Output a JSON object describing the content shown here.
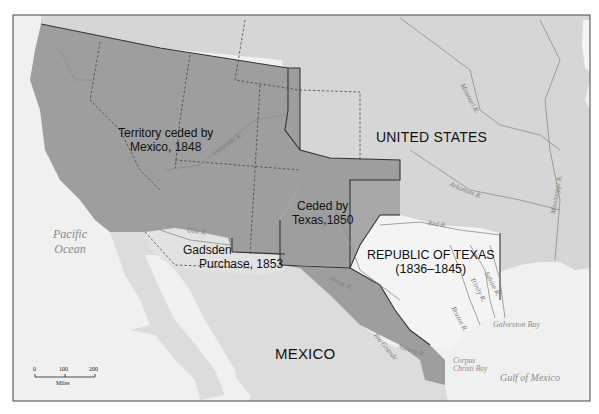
{
  "map": {
    "colors": {
      "ocean": "#f0f0f0",
      "united_states": "#d6d6d6",
      "mexico": "#dcdcdc",
      "cession_1848": "#9e9e9e",
      "texas_cession_1850": "#9e9e9e",
      "republic_of_texas": "#f4f4f4",
      "gadsden_purchase": "#e2e2e2",
      "border_line": "#333333",
      "river_line": "#8c8c8c"
    },
    "region_labels": {
      "cession_1848_line1": "Territory ceded by",
      "cession_1848_line2": "Mexico, 1848",
      "united_states": "UNITED STATES",
      "texas_cession_line1": "Ceded by",
      "texas_cession_line2": "Texas,1850",
      "republic_line1": "REPUBLIC OF TEXAS",
      "republic_line2": "(1836–1845)",
      "gadsden_line1": "Gadsden",
      "gadsden_line2": "Purchase, 1853",
      "mexico": "MEXICO"
    },
    "water_labels": {
      "pacific_line1": "Pacific",
      "pacific_line2": "Ocean",
      "gulf": "Gulf of Mexico",
      "galveston": "Galveston Bay",
      "corpus_line1": "Corpus",
      "corpus_line2": "Christi Bay"
    },
    "rivers": {
      "colorado": "Colorado R.",
      "gila": "Gila R.",
      "missouri": "Missouri R.",
      "arkansas": "Arkansas R.",
      "mississippi": "Mississippi R.",
      "red": "Red R.",
      "pecos": "Pecos R.",
      "rio_grande": "Rio Grande",
      "nueces": "Nueces R.",
      "brazos": "Brazos R.",
      "trinity": "Trinity R.",
      "sabine": "Sabine R."
    },
    "scale_bar": {
      "tick_0": "0",
      "tick_100": "100",
      "tick_200": "200",
      "unit": "Miles"
    }
  }
}
